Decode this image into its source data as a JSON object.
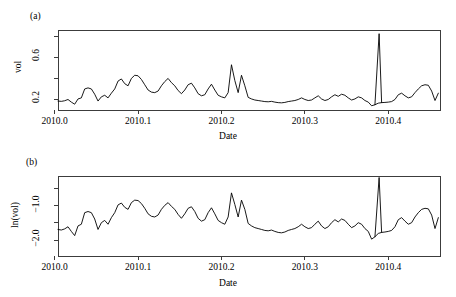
{
  "figure": {
    "panels": [
      {
        "tag": "(a)",
        "xlabel": "Date",
        "ylabel": "vol",
        "xticks": [
          "2010.0",
          "2010.1",
          "2010.2",
          "2010.3",
          "2010.4"
        ],
        "yticks": [
          "0.6",
          "0.2"
        ]
      },
      {
        "tag": "(b)",
        "xlabel": "Date",
        "ylabel": "ln(vol)",
        "xticks": [
          "2010.0",
          "2010.1",
          "2010.2",
          "2010.3",
          "2010.4"
        ],
        "yticks": [
          "-1.0",
          "-2.0"
        ]
      }
    ]
  },
  "chart_data": [
    {
      "type": "line",
      "title": "(a)",
      "xlabel": "Date",
      "ylabel": "vol",
      "xlim": [
        2010.004,
        2010.462
      ],
      "ylim": [
        0.1,
        0.86
      ],
      "xticks": [
        2010.0,
        2010.1,
        2010.2,
        2010.3,
        2010.4
      ],
      "yticks": [
        0.2,
        0.6
      ],
      "yticks_minor": [
        0.4,
        0.8
      ],
      "grid": false,
      "legend": null,
      "line_color": "#000000",
      "x": [
        2010.004,
        2010.008,
        2010.012,
        2010.016,
        2010.02,
        2010.024,
        2010.028,
        2010.032,
        2010.036,
        2010.04,
        2010.044,
        2010.048,
        2010.052,
        2010.056,
        2010.06,
        2010.064,
        2010.068,
        2010.072,
        2010.076,
        2010.08,
        2010.084,
        2010.088,
        2010.092,
        2010.096,
        2010.1,
        2010.104,
        2010.108,
        2010.112,
        2010.116,
        2010.12,
        2010.124,
        2010.128,
        2010.132,
        2010.136,
        2010.14,
        2010.144,
        2010.148,
        2010.152,
        2010.156,
        2010.16,
        2010.164,
        2010.168,
        2010.172,
        2010.176,
        2010.18,
        2010.184,
        2010.188,
        2010.192,
        2010.196,
        2010.2,
        2010.204,
        2010.208,
        2010.212,
        2010.216,
        2010.22,
        2010.224,
        2010.228,
        2010.232,
        2010.236,
        2010.24,
        2010.244,
        2010.248,
        2010.252,
        2010.256,
        2010.26,
        2010.264,
        2010.268,
        2010.272,
        2010.276,
        2010.28,
        2010.284,
        2010.288,
        2010.292,
        2010.296,
        2010.3,
        2010.304,
        2010.308,
        2010.312,
        2010.316,
        2010.32,
        2010.324,
        2010.328,
        2010.332,
        2010.336,
        2010.34,
        2010.344,
        2010.348,
        2010.352,
        2010.356,
        2010.36,
        2010.364,
        2010.368,
        2010.372,
        2010.376,
        2010.38,
        2010.384,
        2010.388,
        2010.392,
        2010.396,
        2010.4,
        2010.404,
        2010.408,
        2010.412,
        2010.416,
        2010.42,
        2010.424,
        2010.428,
        2010.432,
        2010.436,
        2010.44,
        2010.444,
        2010.448,
        2010.452,
        2010.456,
        2010.46
      ],
      "values": [
        0.185,
        0.182,
        0.188,
        0.2,
        0.175,
        0.155,
        0.205,
        0.215,
        0.3,
        0.31,
        0.3,
        0.25,
        0.185,
        0.225,
        0.24,
        0.215,
        0.26,
        0.3,
        0.375,
        0.395,
        0.35,
        0.33,
        0.4,
        0.43,
        0.425,
        0.39,
        0.34,
        0.29,
        0.27,
        0.265,
        0.28,
        0.33,
        0.37,
        0.4,
        0.36,
        0.33,
        0.285,
        0.255,
        0.29,
        0.34,
        0.355,
        0.31,
        0.255,
        0.235,
        0.245,
        0.3,
        0.345,
        0.29,
        0.24,
        0.225,
        0.215,
        0.265,
        0.53,
        0.38,
        0.265,
        0.43,
        0.33,
        0.22,
        0.205,
        0.195,
        0.19,
        0.185,
        0.18,
        0.178,
        0.182,
        0.175,
        0.17,
        0.168,
        0.172,
        0.18,
        0.185,
        0.19,
        0.2,
        0.215,
        0.2,
        0.19,
        0.195,
        0.215,
        0.235,
        0.205,
        0.19,
        0.2,
        0.225,
        0.245,
        0.23,
        0.25,
        0.24,
        0.215,
        0.195,
        0.205,
        0.225,
        0.215,
        0.19,
        0.175,
        0.14,
        0.15,
        0.165,
        0.17,
        0.172,
        0.175,
        0.18,
        0.2,
        0.245,
        0.26,
        0.235,
        0.215,
        0.225,
        0.265,
        0.3,
        0.33,
        0.34,
        0.335,
        0.28,
        0.19,
        0.26
      ],
      "spike": {
        "note": "largest peak near 2010.39",
        "x": 2010.389,
        "y": 0.825
      }
    },
    {
      "type": "line",
      "title": "(b)",
      "xlabel": "Date",
      "ylabel": "ln(vol)",
      "xlim": [
        2010.004,
        2010.462
      ],
      "ylim": [
        -2.45,
        -0.15
      ],
      "xticks": [
        2010.0,
        2010.1,
        2010.2,
        2010.3,
        2010.4
      ],
      "yticks": [
        -1.0,
        -2.0
      ],
      "yticks_minor": [
        -0.5,
        -1.5
      ],
      "grid": false,
      "legend": null,
      "line_color": "#000000",
      "note": "natural logarithm of panel (a) series",
      "x": [
        2010.004,
        2010.008,
        2010.012,
        2010.016,
        2010.02,
        2010.024,
        2010.028,
        2010.032,
        2010.036,
        2010.04,
        2010.044,
        2010.048,
        2010.052,
        2010.056,
        2010.06,
        2010.064,
        2010.068,
        2010.072,
        2010.076,
        2010.08,
        2010.084,
        2010.088,
        2010.092,
        2010.096,
        2010.1,
        2010.104,
        2010.108,
        2010.112,
        2010.116,
        2010.12,
        2010.124,
        2010.128,
        2010.132,
        2010.136,
        2010.14,
        2010.144,
        2010.148,
        2010.152,
        2010.156,
        2010.16,
        2010.164,
        2010.168,
        2010.172,
        2010.176,
        2010.18,
        2010.184,
        2010.188,
        2010.192,
        2010.196,
        2010.2,
        2010.204,
        2010.208,
        2010.212,
        2010.216,
        2010.22,
        2010.224,
        2010.228,
        2010.232,
        2010.236,
        2010.24,
        2010.244,
        2010.248,
        2010.252,
        2010.256,
        2010.26,
        2010.264,
        2010.268,
        2010.272,
        2010.276,
        2010.28,
        2010.284,
        2010.288,
        2010.292,
        2010.296,
        2010.3,
        2010.304,
        2010.308,
        2010.312,
        2010.316,
        2010.32,
        2010.324,
        2010.328,
        2010.332,
        2010.336,
        2010.34,
        2010.344,
        2010.348,
        2010.352,
        2010.356,
        2010.36,
        2010.364,
        2010.368,
        2010.372,
        2010.376,
        2010.38,
        2010.384,
        2010.388,
        2010.392,
        2010.396,
        2010.4,
        2010.404,
        2010.408,
        2010.412,
        2010.416,
        2010.42,
        2010.424,
        2010.428,
        2010.432,
        2010.436,
        2010.44,
        2010.444,
        2010.448,
        2010.452,
        2010.456,
        2010.46
      ],
      "values": [
        -1.687,
        -1.703,
        -1.671,
        -1.609,
        -1.743,
        -1.864,
        -1.585,
        -1.537,
        -1.204,
        -1.171,
        -1.204,
        -1.386,
        -1.687,
        -1.492,
        -1.427,
        -1.537,
        -1.347,
        -1.204,
        -0.981,
        -0.928,
        -1.05,
        -1.109,
        -0.916,
        -0.844,
        -0.856,
        -0.942,
        -1.079,
        -1.238,
        -1.309,
        -1.328,
        -1.273,
        -1.109,
        -0.994,
        -0.916,
        -1.022,
        -1.109,
        -1.255,
        -1.366,
        -1.238,
        -1.079,
        -1.035,
        -1.171,
        -1.366,
        -1.448,
        -1.406,
        -1.204,
        -1.064,
        -1.238,
        -1.427,
        -1.492,
        -1.537,
        -1.328,
        -0.635,
        -0.967,
        -1.328,
        -0.844,
        -1.109,
        -1.514,
        -1.585,
        -1.635,
        -1.661,
        -1.687,
        -1.715,
        -1.726,
        -1.704,
        -1.743,
        -1.772,
        -1.784,
        -1.76,
        -1.715,
        -1.687,
        -1.661,
        -1.609,
        -1.537,
        -1.609,
        -1.661,
        -1.635,
        -1.537,
        -1.448,
        -1.585,
        -1.661,
        -1.609,
        -1.492,
        -1.406,
        -1.47,
        -1.386,
        -1.427,
        -1.537,
        -1.635,
        -1.585,
        -1.492,
        -1.537,
        -1.661,
        -1.743,
        -1.966,
        -1.897,
        -1.802,
        -1.772,
        -1.76,
        -1.743,
        -1.715,
        -1.609,
        -1.406,
        -1.347,
        -1.448,
        -1.537,
        -1.492,
        -1.328,
        -1.204,
        -1.109,
        -1.079,
        -1.094,
        -1.273,
        -1.661,
        -1.347
      ],
      "spike": {
        "note": "largest peak near 2010.39",
        "x": 2010.389,
        "y": -0.192
      }
    }
  ]
}
